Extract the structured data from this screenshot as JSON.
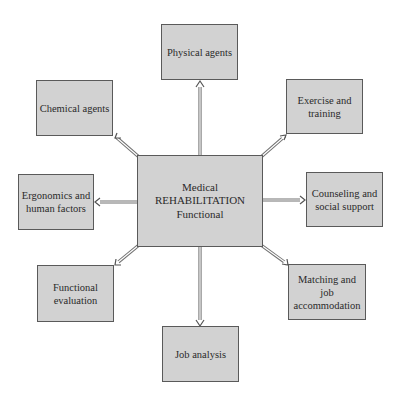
{
  "diagram": {
    "type": "hub-and-spoke",
    "colors": {
      "box_fill": "#d2d2d2",
      "box_border": "#5a5a5a",
      "arrow": "#707070",
      "text": "#2a2a2a"
    },
    "center": {
      "line1": "Medical",
      "line2": "REHABILITATION",
      "line3": "Functional"
    },
    "nodes": {
      "physical_agents": "Physical agents",
      "chemical_agents": "Chemical agents",
      "exercise_training": "Exercise and\ntraining",
      "ergonomics": "Ergonomics and\nhuman factors",
      "counseling": "Counseling and\nsocial support",
      "functional_evaluation": "Functional\nevaluation",
      "matching_job": "Matching and job\naccommodation",
      "job_analysis": "Job analysis"
    },
    "edges": [
      {
        "from": "center",
        "to": "physical_agents"
      },
      {
        "from": "center",
        "to": "chemical_agents"
      },
      {
        "from": "center",
        "to": "exercise_training"
      },
      {
        "from": "center",
        "to": "ergonomics"
      },
      {
        "from": "center",
        "to": "counseling"
      },
      {
        "from": "center",
        "to": "functional_evaluation"
      },
      {
        "from": "center",
        "to": "matching_job"
      },
      {
        "from": "center",
        "to": "job_analysis"
      }
    ]
  }
}
